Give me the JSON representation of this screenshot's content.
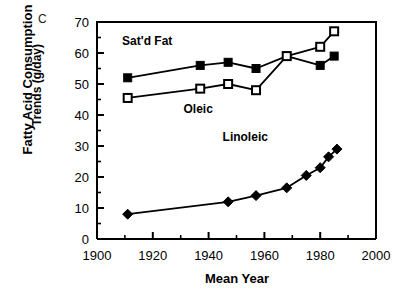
{
  "panel": {
    "label": "C"
  },
  "axes": {
    "ylabel_line1": "Fatty Acid Consumption",
    "ylabel_line2": "Trends (g/day)",
    "xlabel": "Mean Year",
    "xticks": [
      "1900",
      "1920",
      "1940",
      "1960",
      "1980",
      "2000"
    ],
    "yticks": [
      "0",
      "10",
      "20",
      "30",
      "40",
      "50",
      "60",
      "70"
    ]
  },
  "annotations": [
    {
      "name": "satd-fat-label",
      "text": "Sat'd Fat",
      "x": 1909,
      "y": 62.5
    },
    {
      "name": "oleic-label",
      "text": "Oleic",
      "x": 1931,
      "y": 40.5
    },
    {
      "name": "linoleic-label",
      "text": "Linoleic",
      "x": 1945,
      "y": 31.5
    }
  ],
  "chart_data": {
    "type": "line",
    "title": "",
    "xlabel": "Mean Year",
    "ylabel": "Fatty Acid Consumption Trends (g/day)",
    "xlim": [
      1900,
      2000
    ],
    "ylim": [
      0,
      70
    ],
    "xticks": [
      1900,
      1920,
      1940,
      1960,
      1980,
      2000
    ],
    "yticks": [
      0,
      10,
      20,
      30,
      40,
      50,
      60,
      70
    ],
    "xminor_ticks": [
      1910,
      1930,
      1950,
      1970,
      1990
    ],
    "yminor_ticks": [
      5,
      15,
      25,
      35,
      45,
      55,
      65
    ],
    "grid": false,
    "legend": "inline-annotations",
    "series": [
      {
        "name": "Sat'd Fat",
        "marker": "filled-square",
        "color": "#000000",
        "x": [
          1911,
          1937,
          1947,
          1957,
          1968,
          1980,
          1985
        ],
        "values": [
          52,
          56,
          57,
          55,
          59,
          56,
          59
        ]
      },
      {
        "name": "Oleic",
        "marker": "open-square",
        "color": "#000000",
        "x": [
          1911,
          1937,
          1947,
          1957,
          1968,
          1980,
          1985
        ],
        "values": [
          45.5,
          48.5,
          50,
          48,
          59,
          62,
          67
        ]
      },
      {
        "name": "Linoleic",
        "marker": "filled-diamond",
        "color": "#000000",
        "x": [
          1911,
          1947,
          1957,
          1968,
          1975,
          1980,
          1983,
          1986
        ],
        "values": [
          8,
          12,
          14,
          16.5,
          20.5,
          23,
          26.5,
          29
        ]
      }
    ]
  }
}
